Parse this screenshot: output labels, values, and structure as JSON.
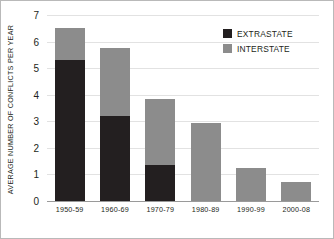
{
  "chart_data": {
    "type": "bar",
    "stacked": true,
    "title": "",
    "subtitle": "",
    "xlabel": "",
    "ylabel": "AVERAGE NUMBER OF CONFLICTS PER YEAR",
    "categories": [
      "1950-59",
      "1960-69",
      "1970-79",
      "1980-89",
      "1990-99",
      "2000-08"
    ],
    "series": [
      {
        "name": "EXTRASTATE",
        "color": "#231f20",
        "values": [
          5.3,
          3.2,
          1.35,
          0,
          0,
          0
        ]
      },
      {
        "name": "INTERSTATE",
        "color": "#8c8c8c",
        "values": [
          1.2,
          2.55,
          2.5,
          2.95,
          1.25,
          0.7
        ]
      }
    ],
    "totals": [
      6.5,
      5.75,
      3.85,
      2.95,
      1.25,
      0.7
    ],
    "ylim": [
      0,
      7
    ],
    "ytick_labels": [
      "0",
      "1",
      "2",
      "3",
      "4",
      "5",
      "6",
      "7"
    ],
    "ytick_values": [
      0,
      1,
      2,
      3,
      4,
      5,
      6,
      7
    ],
    "grid": "horizontal",
    "legend_position": "top-right"
  },
  "legend": {
    "items": [
      {
        "label": "EXTRASTATE",
        "color": "#231f20"
      },
      {
        "label": "INTERSTATE",
        "color": "#8c8c8c"
      }
    ]
  },
  "colors": {
    "extrastate": "#231f20",
    "interstate": "#8c8c8c",
    "gridline": "#e2e2e2",
    "axis": "#9a9a9a",
    "frame": "#b9b9b9",
    "background": "#ffffff",
    "text": "#231f20"
  }
}
